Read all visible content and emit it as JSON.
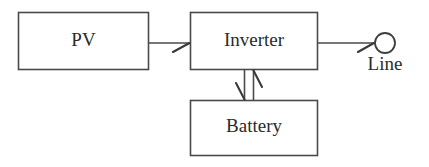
{
  "diagram": {
    "background_color": "#ffffff",
    "line_color": "#4a4a4a",
    "text_color": "#2b2b2b",
    "nodes": [
      {
        "id": "pv",
        "label": "PV",
        "shape": "rectangle"
      },
      {
        "id": "inverter",
        "label": "Inverter",
        "shape": "rectangle"
      },
      {
        "id": "battery",
        "label": "Battery",
        "shape": "rectangle"
      },
      {
        "id": "line",
        "label": "Line",
        "shape": "circle"
      }
    ],
    "edges": [
      {
        "id": "pv-to-inverter",
        "from": "PV",
        "to": "Inverter",
        "direction": "right",
        "arrow": "half-barb"
      },
      {
        "id": "inverter-to-line",
        "from": "Inverter",
        "to": "Line",
        "direction": "right",
        "arrow": "half-barb"
      },
      {
        "id": "inverter-to-battery",
        "from": "Inverter",
        "to": "Battery",
        "direction": "down",
        "arrow": "half-barb"
      },
      {
        "id": "battery-to-inverter",
        "from": "Battery",
        "to": "Inverter",
        "direction": "up",
        "arrow": "half-barb"
      }
    ]
  }
}
